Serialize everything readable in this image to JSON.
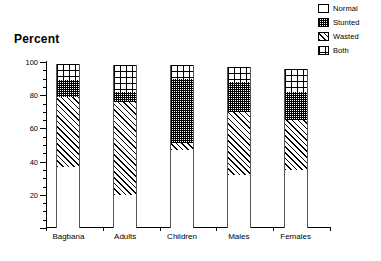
{
  "chart_data": {
    "type": "bar",
    "title": "",
    "ylabel": "Percent",
    "xlabel": "",
    "ylim": [
      0,
      100
    ],
    "y_ticks": [
      0,
      20,
      40,
      60,
      80,
      100
    ],
    "y_tick_labels": [
      "0",
      "20",
      "40",
      "60",
      "80",
      "100"
    ],
    "y_minor_tick_step": 5,
    "grid": false,
    "stacked": true,
    "legend_position": "top-right",
    "categories": [
      "Bagbana",
      "Adults",
      "Children",
      "Males",
      "Females"
    ],
    "series": [
      {
        "name": "Normal",
        "pattern": "empty",
        "values": [
          37,
          20,
          47,
          32,
          35
        ]
      },
      {
        "name": "Wasted",
        "pattern": "diagonal",
        "values": [
          42,
          56,
          4,
          38,
          30
        ]
      },
      {
        "name": "Stunted",
        "pattern": "fine-stipple",
        "values": [
          10,
          6,
          39,
          18,
          17
        ]
      },
      {
        "name": "Both",
        "pattern": "crosshatch",
        "values": [
          10,
          16,
          8,
          9,
          14
        ]
      }
    ],
    "series_tops": {
      "Bagbana": {
        "normal": 37,
        "wasted": 79,
        "stunted": 89,
        "both": 99
      },
      "Adults": {
        "normal": 20,
        "wasted": 76,
        "stunted": 82,
        "both": 98
      },
      "Children": {
        "normal": 47,
        "wasted": 51,
        "stunted": 90,
        "both": 98
      },
      "Males": {
        "normal": 32,
        "wasted": 70,
        "stunted": 88,
        "both": 97
      },
      "Females": {
        "normal": 35,
        "wasted": 65,
        "stunted": 82,
        "both": 96
      }
    }
  },
  "legend": {
    "items": [
      {
        "label": "Normal",
        "swatch": "normal-swatch-icon"
      },
      {
        "label": "Stunted",
        "swatch": "stunted-swatch-icon"
      },
      {
        "label": "Wasted",
        "swatch": "wasted-swatch-icon"
      },
      {
        "label": "Both",
        "swatch": "both-swatch-icon"
      }
    ]
  },
  "axis": {
    "y_title": "Percent"
  }
}
